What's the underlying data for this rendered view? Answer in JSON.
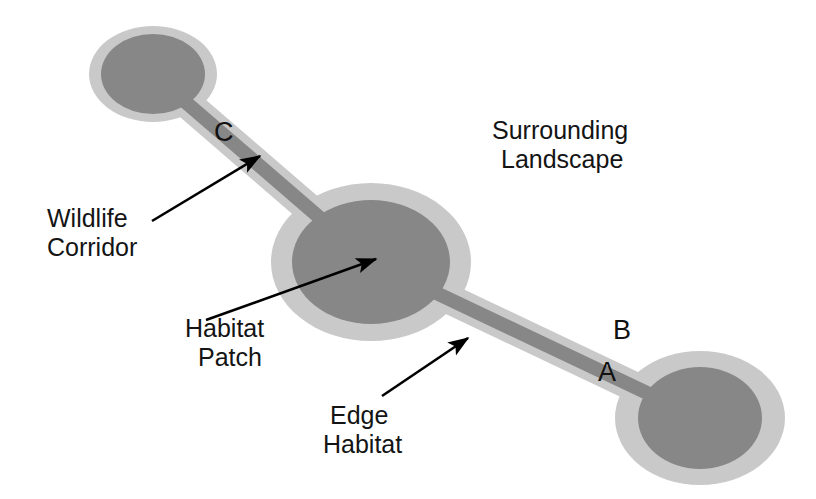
{
  "figure": {
    "background_color": "#ffffff",
    "colors": {
      "habitat_core": "#878787",
      "edge_habitat": "#c9c9c9",
      "surrounding_landscape": "#ffffff",
      "text": "#141414",
      "arrow": "#000000"
    }
  },
  "labels": {
    "surrounding_landscape_line1": "Surrounding",
    "surrounding_landscape_line2": "Landscape",
    "wildlife_corridor_line1": "Wildlife",
    "wildlife_corridor_line2": "Corridor",
    "habitat_patch_line1": "Habitat",
    "habitat_patch_line2": "Patch",
    "edge_habitat_line1": "Edge",
    "edge_habitat_line2": "Habitat"
  },
  "corridor_letters": {
    "a": "A",
    "b": "B",
    "c": "C"
  },
  "patches": [
    {
      "id": "patch-top-left",
      "cx": 153,
      "cy": 74,
      "core_rx": 52,
      "core_ry": 40,
      "edge_rx": 64,
      "edge_ry": 48
    },
    {
      "id": "patch-center",
      "cx": 371,
      "cy": 262,
      "core_rx": 79,
      "core_ry": 62,
      "edge_rx": 100,
      "edge_ry": 79
    },
    {
      "id": "patch-bottom-right",
      "cx": 700,
      "cy": 418,
      "core_rx": 62,
      "core_ry": 51,
      "edge_rx": 85,
      "edge_ry": 67
    }
  ],
  "corridors": [
    {
      "id": "corridor-c",
      "from": "patch-top-left",
      "to": "patch-center",
      "letter": "C",
      "core_width": 14,
      "edge_width": 30
    },
    {
      "id": "corridor-ab",
      "from": "patch-center",
      "to": "patch-bottom-right",
      "letters": [
        "A",
        "B"
      ],
      "core_width": 14,
      "edge_width": 30
    }
  ],
  "annotations": [
    {
      "id": "annotation-wildlife-corridor",
      "target": "corridor-c",
      "arrow_from": [
        152,
        221
      ],
      "arrow_to": [
        262,
        154
      ]
    },
    {
      "id": "annotation-habitat-patch",
      "target": "patch-center",
      "arrow_from": [
        206,
        320
      ],
      "arrow_to": [
        378,
        258
      ]
    },
    {
      "id": "annotation-edge-habitat",
      "target": "corridor-ab",
      "arrow_from": [
        382,
        396
      ],
      "arrow_to": [
        470,
        337
      ]
    }
  ]
}
